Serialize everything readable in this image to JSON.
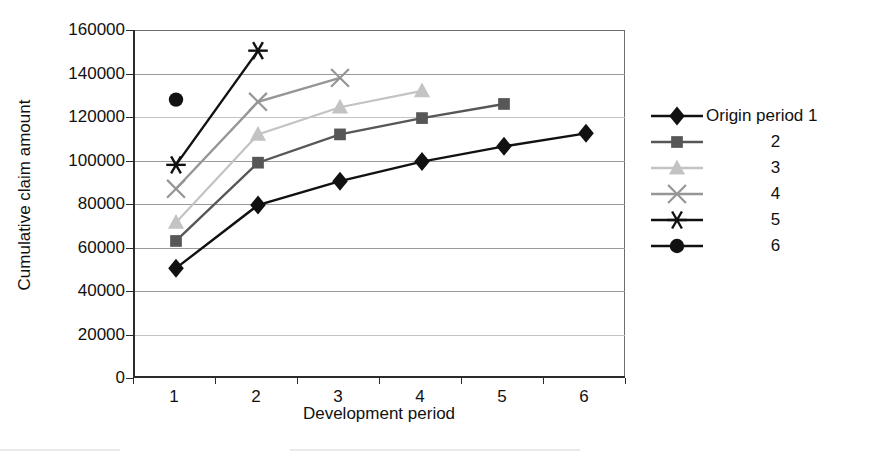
{
  "chart_data": {
    "type": "line",
    "title": "",
    "xlabel": "Development period",
    "ylabel": "Cumulative claim amount",
    "categories": [
      "1",
      "2",
      "3",
      "4",
      "5",
      "6"
    ],
    "ylim": [
      0,
      160000
    ],
    "ytick_labels": [
      "0",
      "20000",
      "40000",
      "60000",
      "80000",
      "100000",
      "120000",
      "140000",
      "160000"
    ],
    "ytick_values": [
      0,
      20000,
      40000,
      60000,
      80000,
      100000,
      120000,
      140000,
      160000
    ],
    "grid": true,
    "legend_position": "right",
    "series": [
      {
        "name": "Origin period 1",
        "marker": "diamond",
        "color": "#111111",
        "x": [
          "1",
          "2",
          "3",
          "4",
          "5",
          "6"
        ],
        "values": [
          50500,
          79500,
          90500,
          99500,
          106500,
          112500
        ]
      },
      {
        "name": "2",
        "marker": "square",
        "color": "#575757",
        "x": [
          "1",
          "2",
          "3",
          "4",
          "5"
        ],
        "values": [
          63000,
          99000,
          112000,
          119500,
          126000
        ]
      },
      {
        "name": "3",
        "marker": "triangle",
        "color": "#c3c3c3",
        "x": [
          "1",
          "2",
          "3",
          "4"
        ],
        "values": [
          71500,
          112000,
          124500,
          132000
        ]
      },
      {
        "name": "4",
        "marker": "cross-x",
        "color": "#969696",
        "x": [
          "1",
          "2",
          "3"
        ],
        "values": [
          87000,
          127000,
          138000
        ]
      },
      {
        "name": "5",
        "marker": "asterisk",
        "color": "#111111",
        "x": [
          "1",
          "2"
        ],
        "values": [
          98000,
          150500
        ]
      },
      {
        "name": "6",
        "marker": "circle",
        "color": "#111111",
        "x": [
          "1"
        ],
        "values": [
          128000
        ]
      }
    ]
  },
  "legend": {
    "items": [
      {
        "label": "Origin period 1",
        "marker": "diamond-icon",
        "color": "#111111"
      },
      {
        "label": "2",
        "marker": "square-icon",
        "color": "#575757"
      },
      {
        "label": "3",
        "marker": "triangle-icon",
        "color": "#c3c3c3"
      },
      {
        "label": "4",
        "marker": "cross-x-icon",
        "color": "#969696"
      },
      {
        "label": "5",
        "marker": "asterisk-icon",
        "color": "#111111"
      },
      {
        "label": "6",
        "marker": "circle-icon",
        "color": "#111111"
      }
    ]
  }
}
